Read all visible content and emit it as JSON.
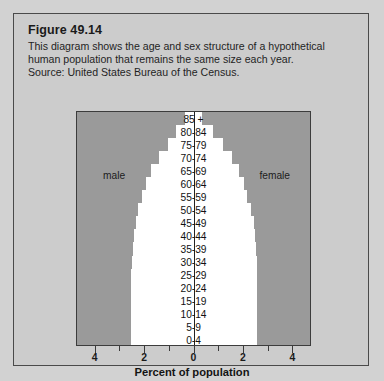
{
  "figure": {
    "title": "Figure 49.14",
    "caption_lines": [
      "This diagram shows the age and sex structure of a hypothetical",
      "human population that remains the same size each year.",
      "Source: United States Bureau of the Census."
    ]
  },
  "chart_data": {
    "type": "bar",
    "subtype": "population-pyramid",
    "title": "",
    "top_axis_label": "age",
    "xlabel": "Percent of population",
    "ylabel": "age",
    "xlim": [
      -4.75,
      4.75
    ],
    "xticks": [
      4,
      3,
      2,
      1,
      0,
      1,
      2,
      3,
      4
    ],
    "xtick_labels": [
      "4",
      "",
      "2",
      "",
      "0",
      "",
      "2",
      "",
      "4"
    ],
    "grid": false,
    "legend_position": "inside-plot",
    "series_labels": {
      "left": "male",
      "right": "female"
    },
    "categories": [
      "85 +",
      "80-84",
      "75-79",
      "70-74",
      "65-69",
      "60-64",
      "55-59",
      "50-54",
      "45-49",
      "40-44",
      "35-39",
      "30-34",
      "25-29",
      "20-24",
      "15-19",
      "10-14",
      "5-9",
      "0-4"
    ],
    "series": [
      {
        "name": "male",
        "values": [
          0.35,
          0.7,
          1.05,
          1.4,
          1.75,
          1.95,
          2.1,
          2.25,
          2.35,
          2.42,
          2.48,
          2.52,
          2.55,
          2.55,
          2.55,
          2.55,
          2.55,
          2.55
        ]
      },
      {
        "name": "female",
        "values": [
          0.35,
          0.8,
          1.2,
          1.55,
          1.85,
          2.05,
          2.2,
          2.35,
          2.45,
          2.5,
          2.55,
          2.58,
          2.6,
          2.6,
          2.6,
          2.6,
          2.6,
          2.6
        ]
      }
    ]
  },
  "colors": {
    "page_background": "#d2d2d2",
    "panel_background": "#cccccc",
    "plot_background": "#9a9a9a",
    "bar_fill": "#ffffff",
    "text": "#1a1a1a",
    "border": "#3c3c3c"
  }
}
